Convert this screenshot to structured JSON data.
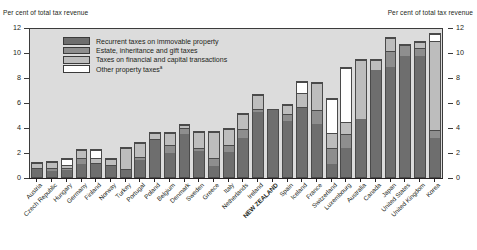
{
  "header": {
    "left_axis_title": "Per cent of total tax revenue",
    "right_axis_title": "Per cent of total tax revenue"
  },
  "legend": {
    "items": [
      {
        "label": "Recurrent taxes on immovable property",
        "color": "#6e6e6e",
        "footnote": ""
      },
      {
        "label": "Estate, inheritance and gift taxes",
        "color": "#8e8e8e",
        "footnote": ""
      },
      {
        "label": "Taxes on financial and capital transactions",
        "color": "#bdbdbd",
        "footnote": ""
      },
      {
        "label": "Other property taxes",
        "color": "#ffffff",
        "footnote": "a"
      }
    ]
  },
  "chart_data": {
    "type": "bar",
    "subtype": "stacked-vertical",
    "title": "",
    "xlabel": "",
    "ylabel": "Per cent of total tax revenue",
    "ylim": [
      0,
      12
    ],
    "yticks": [
      0,
      2,
      4,
      6,
      8,
      10,
      12
    ],
    "ytick_labels": [
      "0",
      "2",
      "4",
      "6",
      "8",
      "10",
      "12"
    ],
    "grid": false,
    "legend_position": "upper-left-inside",
    "highlight_category": "NEW ZEALAND",
    "categories": [
      "Austria",
      "Czech Republic",
      "Hungary",
      "Germany",
      "Finland",
      "Norway",
      "Turkey",
      "Portugal",
      "Poland",
      "Belgium",
      "Denmark",
      "Sweden",
      "Greece",
      "Italy",
      "Netherlands",
      "Ireland",
      "NEW ZEALAND",
      "Spain",
      "Iceland",
      "France",
      "Switzerland",
      "Luxembourg",
      "Australia",
      "Canada",
      "Japan",
      "United States",
      "United Kingdom",
      "Korea"
    ],
    "series": [
      {
        "name": "Recurrent taxes on immovable property",
        "color": "#6e6e6e",
        "values": [
          0.7,
          0.5,
          0.6,
          1.1,
          1.1,
          1.0,
          0.6,
          1.4,
          3.1,
          2.0,
          3.6,
          2.2,
          0.9,
          2.1,
          3.2,
          5.3,
          5.5,
          4.6,
          5.6,
          4.3,
          1.1,
          2.4,
          4.7,
          8.7,
          8.9,
          9.8,
          9.8,
          3.2
        ]
      },
      {
        "name": "Estate, inheritance and gift taxes",
        "color": "#8e8e8e",
        "values": [
          0.1,
          0.3,
          0.2,
          0.5,
          0.1,
          0.1,
          0.1,
          0.3,
          0.1,
          0.7,
          0.5,
          0.2,
          0.7,
          0.6,
          0.8,
          0.3,
          0.0,
          0.6,
          0.1,
          1.2,
          1.3,
          1.1,
          0.0,
          0.0,
          1.3,
          0.9,
          0.7,
          0.6
        ]
      },
      {
        "name": "Taxes on financial and capital transactions",
        "color": "#bdbdbd",
        "values": [
          0.5,
          0.6,
          0.3,
          0.7,
          0.4,
          0.5,
          1.8,
          1.2,
          0.5,
          1.0,
          0.2,
          1.4,
          2.2,
          1.3,
          1.2,
          1.1,
          0.0,
          0.7,
          1.2,
          2.2,
          1.2,
          1.0,
          4.8,
          0.8,
          1.1,
          0.0,
          0.5,
          7.2
        ]
      },
      {
        "name": "Other property taxes",
        "color": "#ffffff",
        "values": [
          0.0,
          0.0,
          0.5,
          0.0,
          0.7,
          0.0,
          0.0,
          0.0,
          0.0,
          0.0,
          0.0,
          0.0,
          0.0,
          0.0,
          0.0,
          0.0,
          0.0,
          0.0,
          0.9,
          0.0,
          2.8,
          4.4,
          0.0,
          0.0,
          0.0,
          0.0,
          0.0,
          0.6
        ]
      }
    ],
    "totals": [
      1.3,
      1.4,
      1.6,
      2.3,
      2.3,
      1.6,
      2.5,
      2.9,
      3.7,
      3.7,
      4.3,
      3.8,
      3.8,
      4.0,
      5.2,
      6.7,
      5.5,
      5.9,
      7.8,
      7.7,
      6.4,
      8.9,
      9.5,
      9.5,
      11.3,
      10.7,
      11.0,
      11.6
    ]
  }
}
